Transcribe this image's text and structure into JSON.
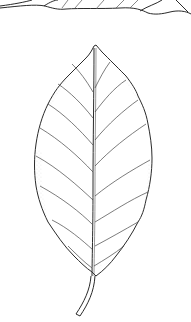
{
  "image": {
    "subject": "botanical line drawing of leaves",
    "background_color": "#ffffff",
    "line_color": "#2a2a2a",
    "stipple_color": "#9a9a9a",
    "elements": [
      {
        "name": "top-leaf-fragment",
        "description": "partial leaf cut off at top edge"
      },
      {
        "name": "main-leaf",
        "description": "ovate serrated leaf with pinnate venation and petiole"
      }
    ]
  }
}
